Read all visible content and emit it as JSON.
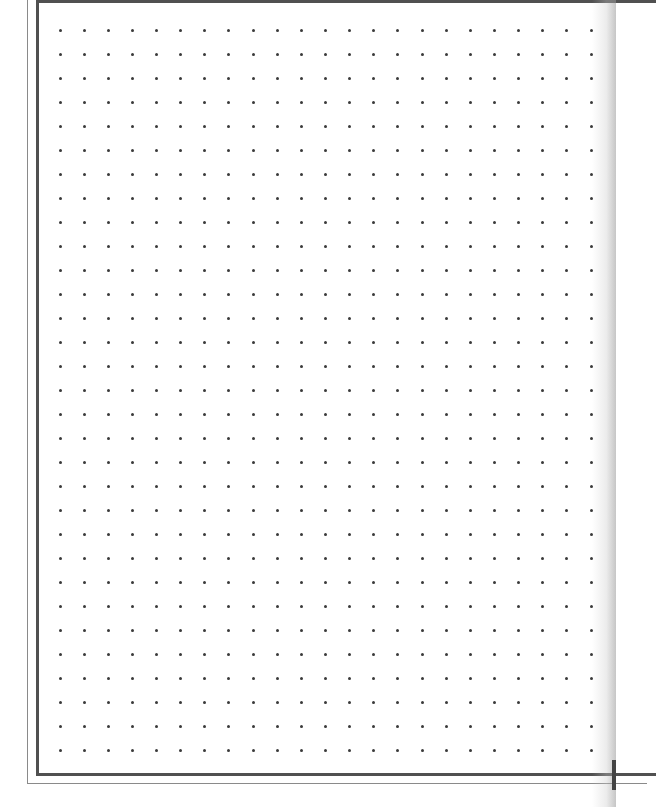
{
  "page": {
    "type": "dot-grid-paper",
    "background_color": "#ffffff",
    "border_color": "#505050",
    "dot_color": "#3a3a3a"
  },
  "grid": {
    "columns": 23,
    "rows": 31,
    "origin_x": 60,
    "origin_y": 30,
    "step_x": 24.14,
    "step_y": 24.0
  }
}
